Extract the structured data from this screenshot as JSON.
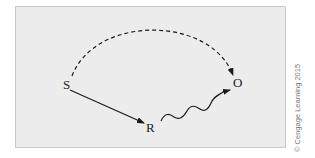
{
  "diagram": {
    "nodes": [
      {
        "id": "S",
        "label": "S"
      },
      {
        "id": "R",
        "label": "R"
      },
      {
        "id": "O",
        "label": "O"
      }
    ],
    "edges": [
      {
        "from": "S",
        "to": "O",
        "style": "dashed-curve"
      },
      {
        "from": "S",
        "to": "R",
        "style": "solid-straight"
      },
      {
        "from": "R",
        "to": "O",
        "style": "wavy"
      }
    ],
    "colors": {
      "panel": "#ececec",
      "stroke": "#1a1a1a"
    }
  },
  "credit": "© Cengage Learning 2015"
}
